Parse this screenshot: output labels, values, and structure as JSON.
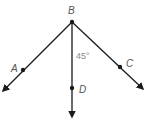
{
  "diagram": {
    "type": "geometry-rays",
    "vertex": {
      "label": "B",
      "x": 72,
      "y": 22
    },
    "rays": [
      {
        "name": "BA",
        "point_label": "A",
        "point": [
          23,
          70
        ],
        "end": [
          3,
          91
        ]
      },
      {
        "name": "BD",
        "point_label": "D",
        "point": [
          72,
          88
        ],
        "end": [
          72,
          117
        ]
      },
      {
        "name": "BC",
        "point_label": "C",
        "point": [
          120,
          67
        ],
        "end": [
          143,
          89
        ]
      }
    ],
    "angle_label": "45°",
    "angle_between": [
      "BD",
      "BC"
    ],
    "labels": {
      "A": "A",
      "B": "B",
      "C": "C",
      "D": "D"
    },
    "colors": {
      "line": "#1a1a1a",
      "label": "#555555",
      "angle_text": "#8a8a8a"
    }
  }
}
